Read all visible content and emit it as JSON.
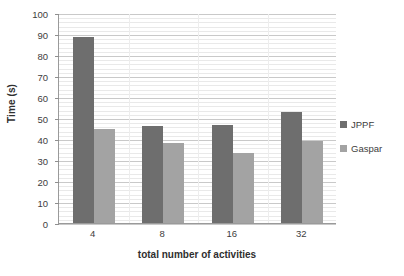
{
  "chart_data": {
    "type": "bar",
    "title": "",
    "subtitle": "",
    "categories": [
      "4",
      "8",
      "16",
      "32"
    ],
    "series": [
      {
        "name": "JPPF",
        "values": [
          88.5,
          46.0,
          46.5,
          53.0
        ],
        "color": "#6e6e6e"
      },
      {
        "name": "Gaspar",
        "values": [
          45.0,
          38.0,
          33.5,
          39.0
        ],
        "color": "#a3a3a3"
      }
    ],
    "xlabel": "total number of activities",
    "ylabel": "Time (s)",
    "ylim": [
      0,
      100
    ],
    "y_major_step": 10,
    "y_minor_step": 2,
    "y_ticks": [
      "0",
      "10",
      "20",
      "30",
      "40",
      "50",
      "60",
      "70",
      "80",
      "90",
      "100"
    ],
    "grid": true,
    "grid_axis": "y",
    "legend_position": "right",
    "legend": [
      "JPPF",
      "Gaspar"
    ],
    "colors": {
      "series_1": "#6e6e6e",
      "series_2": "#a3a3a3",
      "grid_major": "#c9c9c9",
      "grid_minor": "#e9e9e9",
      "axis": "#9a9a9a",
      "text": "#3d3d3d",
      "background": "#ffffff"
    }
  }
}
